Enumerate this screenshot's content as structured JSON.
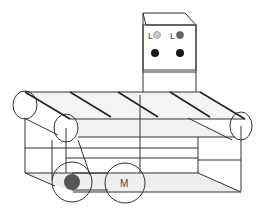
{
  "diagram": {
    "control_box": {
      "lamps": [
        {
          "label": "L",
          "color": "#c8c8c8"
        },
        {
          "label": "L",
          "color": "#666666"
        }
      ],
      "buttons": [
        {
          "color": "#1a1a1a"
        },
        {
          "color": "#1a1a1a"
        }
      ]
    },
    "motor": {
      "label": "M"
    },
    "drive_pulley": {
      "color": "#555555"
    },
    "colors": {
      "line": "#333333",
      "belt_fill": "#f2f2f2",
      "base_fill": "#eeeeee"
    }
  }
}
